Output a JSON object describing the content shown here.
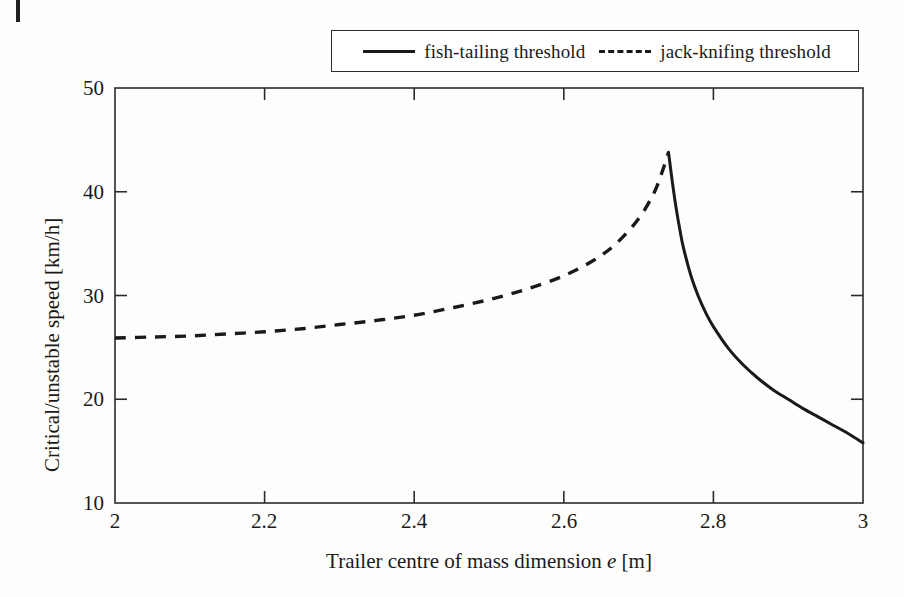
{
  "figure": {
    "background_color": "#fdfdfb",
    "ink_color": "#1a1a1a"
  },
  "legend": {
    "entries": [
      {
        "label": "fish-tailing threshold",
        "style": "solid"
      },
      {
        "label": "jack-knifing threshold",
        "style": "dashed"
      }
    ]
  },
  "axes": {
    "x_title_prefix": "Trailer centre of mass dimension ",
    "x_title_symbol": "e",
    "x_title_suffix": " [m]",
    "y_title": "Critical/unstable speed [km/h]",
    "x_ticks": [
      "2",
      "2.2",
      "2.4",
      "2.6",
      "2.8",
      "3"
    ],
    "y_ticks": [
      "10",
      "20",
      "30",
      "40",
      "50"
    ]
  },
  "chart_data": {
    "type": "line",
    "title": "",
    "xlabel": "Trailer centre of mass dimension e [m]",
    "ylabel": "Critical/unstable speed [km/h]",
    "xlim": [
      2,
      3
    ],
    "ylim": [
      10,
      50
    ],
    "xticks": [
      2,
      2.2,
      2.4,
      2.6,
      2.8,
      3
    ],
    "yticks": [
      10,
      20,
      30,
      40,
      50
    ],
    "grid": false,
    "legend_position": "top-center-outside",
    "annotations": [],
    "critical_point": {
      "e": 2.74,
      "speed": 43.8
    },
    "series": [
      {
        "name": "jack-knifing threshold",
        "style": "dashed",
        "color": "#1a1a1a",
        "x": [
          2.0,
          2.05,
          2.1,
          2.15,
          2.2,
          2.25,
          2.3,
          2.35,
          2.4,
          2.45,
          2.5,
          2.55,
          2.6,
          2.64,
          2.67,
          2.7,
          2.72,
          2.73,
          2.74
        ],
        "y": [
          25.9,
          26.0,
          26.1,
          26.3,
          26.5,
          26.8,
          27.2,
          27.6,
          28.1,
          28.8,
          29.6,
          30.6,
          31.9,
          33.4,
          35.0,
          37.4,
          39.8,
          41.6,
          43.8
        ]
      },
      {
        "name": "fish-tailing threshold",
        "style": "solid",
        "color": "#1a1a1a",
        "x": [
          2.74,
          2.745,
          2.75,
          2.755,
          2.76,
          2.77,
          2.78,
          2.79,
          2.8,
          2.82,
          2.84,
          2.86,
          2.88,
          2.9,
          2.92,
          2.94,
          2.96,
          2.98,
          3.0
        ],
        "y": [
          43.8,
          41.0,
          38.5,
          36.4,
          34.6,
          31.9,
          29.9,
          28.3,
          27.0,
          24.9,
          23.3,
          22.0,
          20.9,
          20.0,
          19.1,
          18.3,
          17.5,
          16.7,
          15.8
        ]
      }
    ]
  }
}
